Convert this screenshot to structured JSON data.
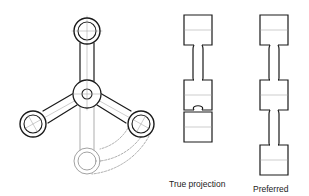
{
  "figure": {
    "labels": {
      "true_projection": "True projection",
      "preferred": "Preferred"
    },
    "colors": {
      "outline": "#1a1a1a",
      "centerline": "#9a9a9a",
      "ghost": "#8a8a8a",
      "background": "#ffffff"
    },
    "spider_view": {
      "hub": {
        "cx": 87,
        "cy": 94,
        "r_outer": 14,
        "r_inner": 5
      },
      "bosses": [
        {
          "name": "top",
          "cx": 87,
          "cy": 31,
          "r_outer": 13,
          "r_inner": 9
        },
        {
          "name": "left",
          "cx": 33,
          "cy": 124,
          "r_outer": 13,
          "r_inner": 9
        },
        {
          "name": "right",
          "cx": 141,
          "cy": 124,
          "r_outer": 13,
          "r_inner": 9
        }
      ],
      "revolved_boss": {
        "cx": 87,
        "cy": 161,
        "r_outer": 13,
        "r_inner": 9
      }
    },
    "true_projection_view": {
      "blocks": [
        {
          "x": 184,
          "y": 15,
          "w": 28,
          "h": 30
        },
        {
          "x": 184,
          "y": 80,
          "w": 28,
          "h": 30
        },
        {
          "x": 184,
          "y": 112,
          "w": 28,
          "h": 30
        }
      ]
    },
    "preferred_view": {
      "blocks": [
        {
          "x": 260,
          "y": 15,
          "w": 28,
          "h": 30
        },
        {
          "x": 260,
          "y": 80,
          "w": 28,
          "h": 30
        },
        {
          "x": 260,
          "y": 145,
          "w": 28,
          "h": 30
        }
      ]
    }
  }
}
